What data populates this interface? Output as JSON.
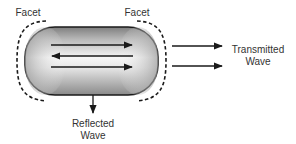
{
  "diagram": {
    "labels": {
      "facet_left": "Facet",
      "facet_right": "Facet",
      "transmitted_line1": "Transmitted",
      "transmitted_line2": "Wave",
      "reflected_line1": "Reflected",
      "reflected_line2": "Wave"
    },
    "elements": {
      "cavity": "gain-medium-capsule",
      "internal_arrows": [
        "right",
        "left",
        "right"
      ],
      "transmitted_arrows": 2,
      "reflected_arrows": 1,
      "facets": [
        "left-dashed-arc",
        "right-dashed-arc"
      ]
    },
    "colors": {
      "stroke": "#1a1a1a",
      "text": "#333333",
      "gradient_light": "#f4f4f4",
      "gradient_dark": "#8c8c8c"
    }
  }
}
